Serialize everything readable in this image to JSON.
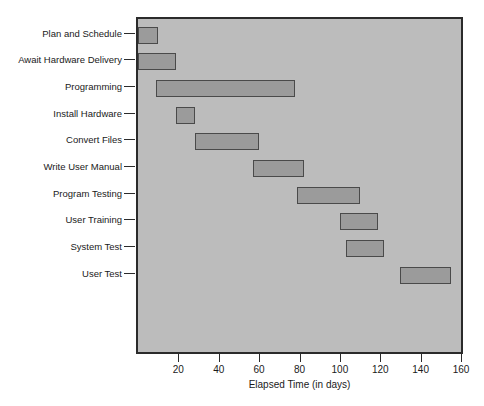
{
  "chart_data": {
    "type": "bar",
    "subtype": "gantt",
    "title": "",
    "xlabel": "Elapsed Time (in days)",
    "ylabel": "",
    "xlim": [
      0,
      160
    ],
    "xticks": [
      20,
      40,
      60,
      80,
      100,
      120,
      140,
      160
    ],
    "grid": false,
    "legend": null,
    "orientation": "horizontal",
    "categories": [
      "Plan and Schedule",
      "Await Hardware Delivery",
      "Programming",
      "Install Hardware",
      "Convert Files",
      "Write User Manual",
      "Program Testing",
      "User Training",
      "System Test",
      "User Test"
    ],
    "tasks": [
      {
        "label": "Plan and Schedule",
        "start": 0,
        "end": 10,
        "duration": 10
      },
      {
        "label": "Await Hardware Delivery",
        "start": 0,
        "end": 19,
        "duration": 19
      },
      {
        "label": "Programming",
        "start": 9,
        "end": 78,
        "duration": 69
      },
      {
        "label": "Install Hardware",
        "start": 19,
        "end": 28,
        "duration": 9
      },
      {
        "label": "Convert Files",
        "start": 28,
        "end": 60,
        "duration": 32
      },
      {
        "label": "Write User Manual",
        "start": 57,
        "end": 82,
        "duration": 25
      },
      {
        "label": "Program Testing",
        "start": 79,
        "end": 110,
        "duration": 31
      },
      {
        "label": "User Training",
        "start": 100,
        "end": 119,
        "duration": 19
      },
      {
        "label": "System Test",
        "start": 103,
        "end": 122,
        "duration": 19
      },
      {
        "label": "User Test",
        "start": 130,
        "end": 155,
        "duration": 25
      }
    ],
    "colors": {
      "bar_fill": "#9b9b9b",
      "bar_border": "#4a4a4a",
      "plot_background": "#bcbcbc",
      "frame": "#2b2b2b",
      "text": "#1a1a1a",
      "page_background": "#ffffff"
    }
  }
}
